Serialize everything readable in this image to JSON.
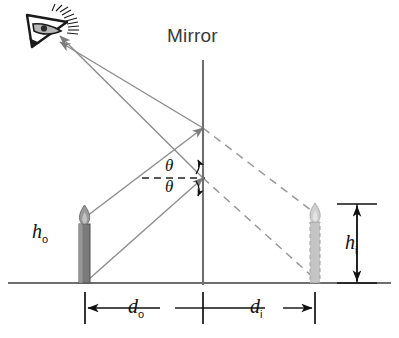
{
  "figure": {
    "background_color": "#ffffff"
  },
  "labels": {
    "mirror": "Mirror",
    "object_height": "h",
    "object_height_sub": "o",
    "image_height": "h",
    "image_height_sub": "i",
    "object_distance": "d",
    "object_distance_sub": "o",
    "image_distance": "d",
    "image_distance_sub": "i",
    "angle_incidence": "θ",
    "angle_reflection": "θ"
  },
  "colors": {
    "ray": "#8c8c8c",
    "virtual_ray": "#9a9a9a",
    "mirror_line": "#6f6f6f",
    "ground_line": "#6f6f6f",
    "candle_body": "#7a7a7a",
    "candle_body_dark": "#5c5c5c",
    "image_candle_body": "#b0b0b0",
    "flame": "#8a8a8a",
    "dimension_line": "#1a1a1a",
    "text": "#111111",
    "mirror_text": "#3a3a3a",
    "eye": "#1a1a1a"
  },
  "elements": {
    "eye_name": "observer eye",
    "mirror_name": "plane mirror surface",
    "object_name": "object candle",
    "image_name": "virtual image candle",
    "ground_name": "ground reference line"
  },
  "geometry": {
    "mirror_x": 203,
    "mirror_top_y": 60,
    "mirror_bottom_y": 285,
    "ground_y": 283,
    "object_x": 85,
    "image_x": 315,
    "reflection_point_upper_y": 128,
    "reflection_point_lower_y": 178,
    "eye_x": 48,
    "eye_y": 30,
    "dimension_line_y": 307,
    "object_candle_top_y": 212,
    "image_candle_top_y": 208
  }
}
